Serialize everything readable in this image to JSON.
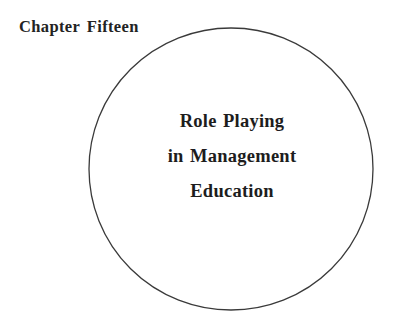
{
  "page": {
    "background_color": "#ffffff",
    "ink_color": "#232323",
    "width": 397,
    "height": 317
  },
  "chapter_label": {
    "text": "Chapter Fifteen",
    "color": "#232323"
  },
  "circle": {
    "name": "chapter-title-circle",
    "center_x": 231,
    "center_y": 169,
    "radius_x": 142,
    "radius_y": 141,
    "stroke_color": "#3a3a3a",
    "stroke_width": 1.3,
    "fill": "none"
  },
  "circle_title": {
    "lines": [
      "Role Playing",
      "in Management",
      "Education"
    ],
    "color": "#1d1d1d"
  }
}
